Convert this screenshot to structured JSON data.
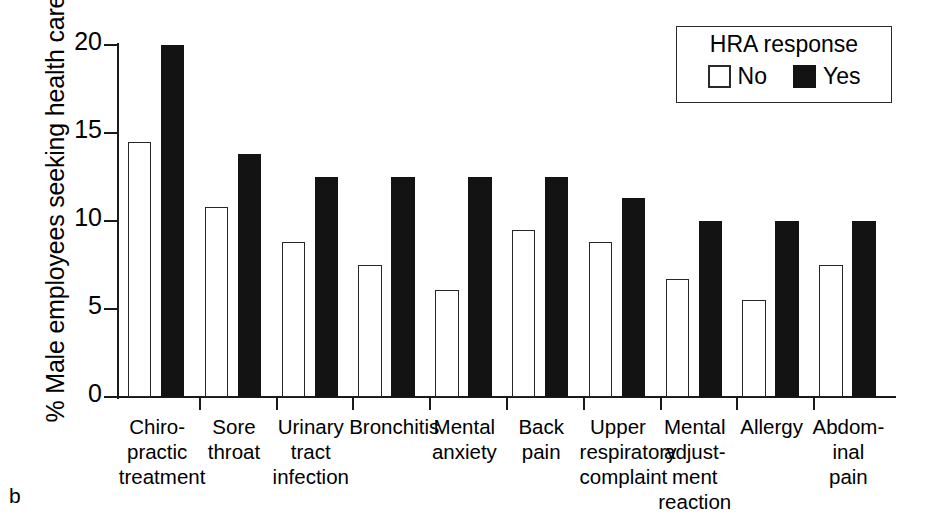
{
  "panel": {
    "letter": "b"
  },
  "legend": {
    "title": "HRA response",
    "entries": [
      {
        "label": "No",
        "color": "#ffffff",
        "swatch": "open-square"
      },
      {
        "label": "Yes",
        "color": "#131313",
        "swatch": "filled-square"
      }
    ]
  },
  "axes": {
    "ylabel": "% Male employees seeking health care",
    "yticklabels": [
      "0",
      "5",
      "10",
      "15",
      "20"
    ],
    "xlabel": ""
  },
  "chart_data": {
    "type": "bar",
    "title": "",
    "xlabel": "",
    "ylabel": "% Male employees seeking health care",
    "ylim": [
      0,
      20
    ],
    "yticks": [
      0,
      5,
      10,
      15,
      20
    ],
    "grid": false,
    "legend_title": "HRA response",
    "legend_position": "top-right",
    "categories": [
      "Chiro-\npractic\ntreatment",
      "Sore\nthroat",
      "Urinary\ntract\ninfection",
      "Bronchitis",
      "Mental\nanxiety",
      "Back\npain",
      "Upper\nrespiratory\ncomplaint",
      "Mental\nadjust-\nment\nreaction",
      "Allergy",
      "Abdom-\ninal\npain"
    ],
    "series": [
      {
        "name": "No",
        "color": "#ffffff",
        "values": [
          14.5,
          10.8,
          8.8,
          7.5,
          6.1,
          9.5,
          8.8,
          6.7,
          5.5,
          7.5
        ]
      },
      {
        "name": "Yes",
        "color": "#131313",
        "values": [
          20.0,
          13.8,
          12.5,
          12.5,
          12.5,
          12.5,
          11.3,
          10.0,
          10.0,
          10.0
        ]
      }
    ]
  }
}
